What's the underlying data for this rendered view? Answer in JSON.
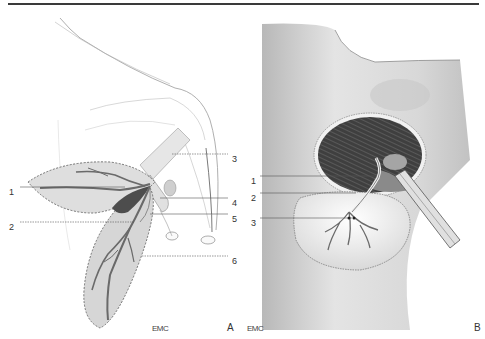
{
  "figure": {
    "panels": [
      {
        "id": "A",
        "letter": "A",
        "watermark": "EMC",
        "callouts": [
          {
            "number": "1"
          },
          {
            "number": "2"
          },
          {
            "number": "3"
          },
          {
            "number": "4"
          },
          {
            "number": "5"
          },
          {
            "number": "6"
          }
        ]
      },
      {
        "id": "B",
        "letter": "B",
        "watermark": "EMC",
        "callouts": [
          {
            "number": "1"
          },
          {
            "number": "2"
          },
          {
            "number": "3"
          }
        ]
      }
    ],
    "colors": {
      "rule": "#3a3a3a",
      "flap_fill": "#dedede",
      "vessel": "#6a6a6a",
      "skin": "#cfcfcf",
      "muscle": "#4a4a4a",
      "text": "#333333"
    }
  }
}
